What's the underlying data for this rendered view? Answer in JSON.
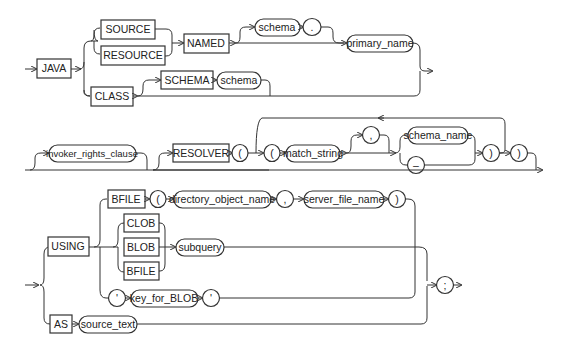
{
  "diagram": {
    "type": "railroad-syntax",
    "keywords": {
      "java": "JAVA",
      "source": "SOURCE",
      "resource": "RESOURCE",
      "named": "NAMED",
      "class": "CLASS",
      "schema_kw": "SCHEMA",
      "resolver": "RESOLVER",
      "using": "USING",
      "bfile": "BFILE",
      "clob": "CLOB",
      "blob": "BLOB",
      "bfile2": "BFILE",
      "as": "AS"
    },
    "nonterminals": {
      "schema": "schema",
      "primary_name": "primary_name",
      "schema2": "schema",
      "invoker_rights_clause": "invoker_rights_clause",
      "match_string": "match_string",
      "schema_name": "schema_name",
      "directory_object_name": "directory_object_name",
      "server_file_name": "server_file_name",
      "subquery": "subquery",
      "key_for_BLOB": "key_for_BLOB",
      "source_text": "source_text"
    },
    "symbols": {
      "dot": ".",
      "lparen_outer": "(",
      "lparen_inner": "(",
      "comma_resolver": ",",
      "dash": "–",
      "rparen_inner": ")",
      "rparen_outer": ")",
      "lparen_bfile": "(",
      "comma_bfile": ",",
      "rparen_bfile": ")",
      "quote_open": "'",
      "quote_close": "'",
      "semicolon": ";"
    }
  }
}
